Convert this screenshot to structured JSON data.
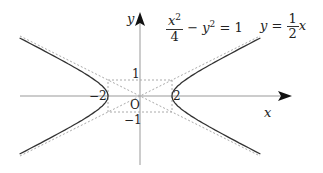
{
  "figure": {
    "equation": {
      "numerator": "x",
      "numerator_exp": "2",
      "denominator": "4",
      "rest": "− y",
      "rest_exp": "2",
      "rhs": "= 1"
    },
    "asymptote_label": {
      "lhs": "y =",
      "numerator": "1",
      "denominator": "2",
      "var": "x"
    },
    "axis_x_label": "x",
    "axis_y_label": "y",
    "origin_label": "O",
    "ticks": {
      "x_neg": "−2",
      "x_pos": "2",
      "y_pos": "1",
      "y_neg": "−1"
    },
    "colors": {
      "curve": "#333333",
      "axis": "#999999",
      "dashed": "#aaaaaa"
    }
  }
}
